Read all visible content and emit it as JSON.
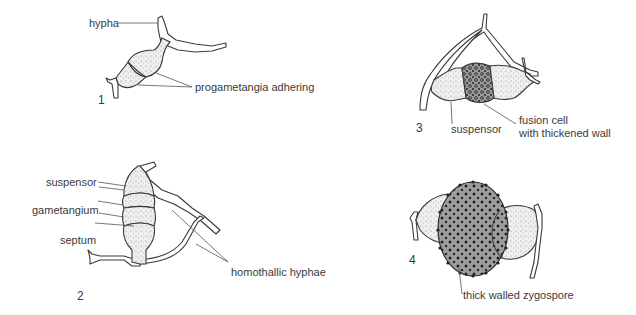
{
  "figure": {
    "panels": [
      {
        "number": "1",
        "labels": {
          "hypha": "hypha",
          "progametangia": "progametangia adhering"
        }
      },
      {
        "number": "2",
        "labels": {
          "suspensor": "suspensor",
          "gametangium": "gametangium",
          "septum": "septum",
          "homothallic": "homothallic hyphae"
        }
      },
      {
        "number": "3",
        "labels": {
          "suspensor": "suspensor",
          "fusion_line1": "fusion cell",
          "fusion_line2": "with thickened wall"
        }
      },
      {
        "number": "4",
        "labels": {
          "zygospore": "thick walled zygospore"
        }
      }
    ]
  }
}
